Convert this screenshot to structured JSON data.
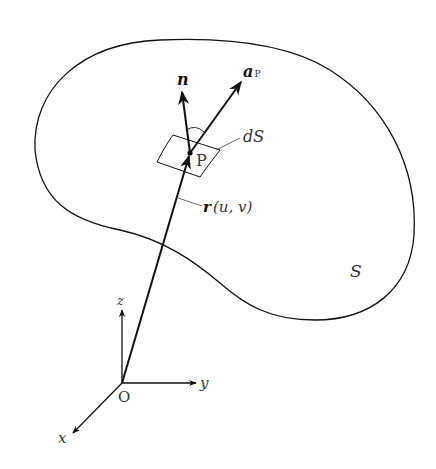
{
  "figure": {
    "surface_label": "S",
    "point_label": "P",
    "origin_label": "O",
    "element_label": "dS",
    "normal_label": "n",
    "vector_label_main": "a",
    "vector_label_sub": "P",
    "position_label": "r",
    "position_args": "(u, v)",
    "axes": {
      "x": "x",
      "y": "y",
      "z": "z"
    }
  },
  "colors": {
    "stroke": "#111111",
    "label": "#333333",
    "background": "#ffffff"
  }
}
